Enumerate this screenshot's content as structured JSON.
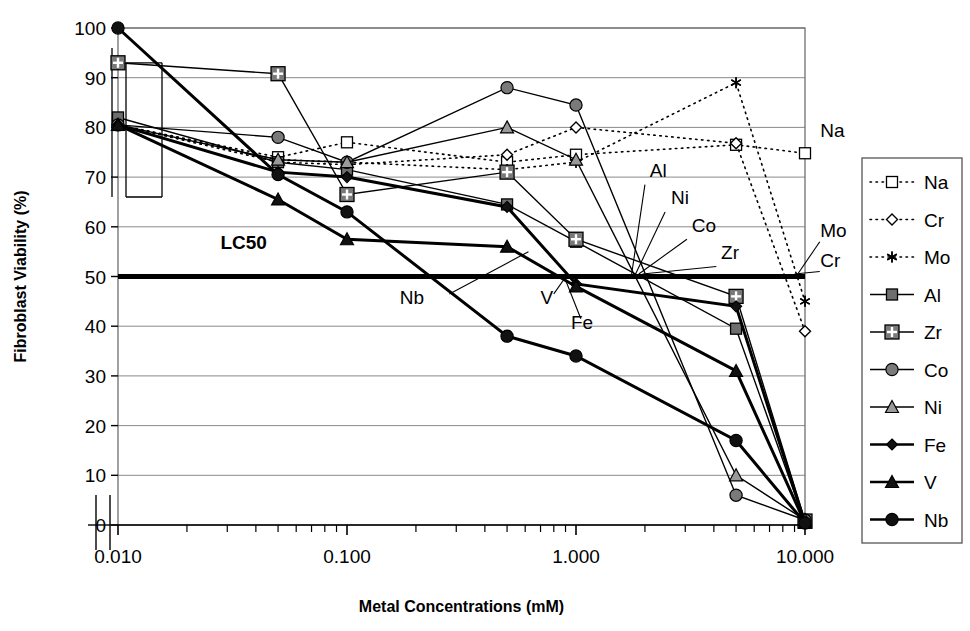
{
  "chart_data": {
    "type": "line",
    "title": "",
    "xlabel": "Metal Concentrations (mM)",
    "ylabel": "Fibroblast Viability (%)",
    "x_scale": "log",
    "xlim": [
      0.01,
      10.0
    ],
    "ylim": [
      0,
      100
    ],
    "xticks": [
      "0.010",
      "0.100",
      "1.000",
      "10.000"
    ],
    "xtick_values": [
      0.01,
      0.1,
      1.0,
      10.0
    ],
    "yticks": [
      "0",
      "10",
      "20",
      "30",
      "40",
      "50",
      "60",
      "70",
      "80",
      "90",
      "100"
    ],
    "ytick_values": [
      0,
      10,
      20,
      30,
      40,
      50,
      60,
      70,
      80,
      90,
      100
    ],
    "grid": "horizontal",
    "legend_position": "right",
    "x": [
      0.01,
      0.05,
      0.1,
      0.5,
      1.0,
      5.0,
      10.0
    ],
    "series": [
      {
        "name": "Na",
        "style": "dotted",
        "marker": "open-square",
        "color": "#000000",
        "fill": "#ffffff",
        "values": [
          80.5,
          74.0,
          77.0,
          73.0,
          74.5,
          76.5,
          74.8
        ]
      },
      {
        "name": "Cr",
        "style": "dotted",
        "marker": "open-diamond",
        "color": "#000000",
        "fill": "#ffffff",
        "values": [
          80.5,
          73.0,
          72.5,
          74.5,
          80.0,
          76.8,
          39.0
        ]
      },
      {
        "name": "Mo",
        "style": "dotted",
        "marker": "asterisk",
        "color": "#000000",
        "fill": "none",
        "values": [
          80.5,
          73.5,
          73.0,
          71.5,
          73.0,
          89.0,
          45.0
        ]
      },
      {
        "name": "Al",
        "style": "solid",
        "marker": "square",
        "color": "#000000",
        "fill": "#6e6e6e",
        "values": [
          82.0,
          73.0,
          71.5,
          64.5,
          57.0,
          39.5,
          0.5
        ]
      },
      {
        "name": "Zr",
        "style": "solid",
        "marker": "cross-square",
        "color": "#000000",
        "fill": "#7a7a7a",
        "values": [
          93.0,
          90.8,
          66.5,
          71.0,
          57.5,
          46.0,
          0.8
        ]
      },
      {
        "name": "Co",
        "style": "solid",
        "marker": "circle",
        "color": "#000000",
        "fill": "#7a7a7a",
        "values": [
          80.5,
          78.0,
          73.0,
          88.0,
          84.5,
          6.0,
          1.0
        ]
      },
      {
        "name": "Ni",
        "style": "solid",
        "marker": "triangle",
        "color": "#000000",
        "fill": "#9a9a9a",
        "values": [
          80.5,
          73.5,
          73.0,
          80.0,
          73.5,
          10.0,
          1.0
        ]
      },
      {
        "name": "Fe",
        "style": "solid",
        "marker": "diamond",
        "color": "#000000",
        "fill": "#111111",
        "values": [
          80.5,
          71.0,
          70.0,
          64.0,
          48.5,
          44.0,
          0.4
        ]
      },
      {
        "name": "V",
        "style": "solid",
        "marker": "triangle",
        "color": "#000000",
        "fill": "#111111",
        "values": [
          80.5,
          65.5,
          57.5,
          56.0,
          48.0,
          31.0,
          0.4
        ]
      },
      {
        "name": "Nb",
        "style": "solid",
        "marker": "circle",
        "color": "#000000",
        "fill": "#111111",
        "values": [
          100.0,
          70.5,
          63.0,
          38.0,
          34.0,
          17.0,
          0.4
        ]
      }
    ],
    "threshold": {
      "label": "LC50",
      "value": 50
    },
    "annotations": [
      {
        "text": "LC50",
        "x": 0.028,
        "y": 55.5
      },
      {
        "text": "Nb",
        "x": 0.17,
        "y": 44.5
      },
      {
        "text": "V",
        "x": 0.7,
        "y": 44.5
      },
      {
        "text": "Fe",
        "x": 0.95,
        "y": 39.5
      },
      {
        "text": "Al",
        "x": 2.1,
        "y": 70.0
      },
      {
        "text": "Ni",
        "x": 2.6,
        "y": 64.5
      },
      {
        "text": "Co",
        "x": 3.2,
        "y": 59.0
      },
      {
        "text": "Zr",
        "x": 4.3,
        "y": 53.5
      },
      {
        "text": "Na",
        "x": 12.0,
        "y": 78.0
      },
      {
        "text": "Mo",
        "x": 12.0,
        "y": 58.0
      },
      {
        "text": "Cr",
        "x": 12.0,
        "y": 52.0
      }
    ]
  },
  "legend": {
    "items": [
      {
        "label": "Na"
      },
      {
        "label": "Cr"
      },
      {
        "label": "Mo"
      },
      {
        "label": "Al"
      },
      {
        "label": "Zr"
      },
      {
        "label": "Co"
      },
      {
        "label": "Ni"
      },
      {
        "label": "Fe"
      },
      {
        "label": "V"
      },
      {
        "label": "Nb"
      }
    ]
  }
}
